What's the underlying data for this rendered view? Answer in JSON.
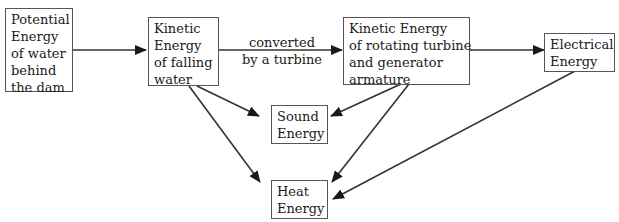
{
  "diagram": {
    "nodes": {
      "potential": {
        "lines": [
          "Potential",
          "Energy",
          "of water",
          "behind",
          "the dam"
        ]
      },
      "kinetic_water": {
        "lines": [
          "Kinetic",
          "Energy",
          "of falling",
          "water"
        ]
      },
      "kinetic_turbine": {
        "lines": [
          "Kinetic Energy",
          "of rotating turbine",
          "and generator",
          "armature"
        ]
      },
      "electrical": {
        "lines": [
          "Electrical",
          "Energy"
        ]
      },
      "sound": {
        "lines": [
          "Sound",
          "Energy"
        ]
      },
      "heat": {
        "lines": [
          "Heat",
          "Energy"
        ]
      }
    },
    "edge_label": {
      "lines": [
        "converted",
        "by a turbine"
      ]
    },
    "edges": [
      {
        "from": "potential",
        "to": "kinetic_water"
      },
      {
        "from": "kinetic_water",
        "to": "kinetic_turbine",
        "label": "converted by a turbine"
      },
      {
        "from": "kinetic_turbine",
        "to": "electrical"
      },
      {
        "from": "kinetic_water",
        "to": "sound"
      },
      {
        "from": "kinetic_water",
        "to": "heat"
      },
      {
        "from": "kinetic_turbine",
        "to": "sound"
      },
      {
        "from": "kinetic_turbine",
        "to": "heat"
      },
      {
        "from": "electrical",
        "to": "heat"
      }
    ]
  }
}
